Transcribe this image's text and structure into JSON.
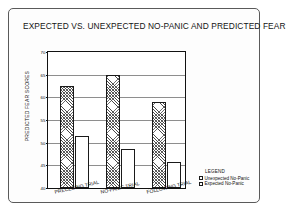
{
  "figure": {
    "title": "EXPECTED VS. UNEXPECTED NO-PANIC AND PREDICTED FEAR"
  },
  "chart_data": {
    "type": "bar",
    "title": "EXPECTED VS. UNEXPECTED NO-PANIC AND PREDICTED FEAR",
    "xlabel": "",
    "ylabel": "PREDICTED FEAR SCORES",
    "ylim": [
      40,
      70
    ],
    "yticks": [
      40,
      45,
      50,
      55,
      60,
      65,
      70
    ],
    "ytick_labels": [
      "40",
      "45",
      "50",
      "55",
      "60",
      "65",
      "70"
    ],
    "grid": true,
    "legend_position": "right-bottom-outside",
    "legend_title": "LEGEND",
    "categories": [
      "PRECEDING TRIAL",
      "NO-PANIC TRIAL",
      "FOLLOWING TRIAL"
    ],
    "series": [
      {
        "name": "Unexpected No-Panic",
        "fill": "hatched",
        "values": [
          62.6,
          65.0,
          59.0
        ]
      },
      {
        "name": "Expected No-Panic",
        "fill": "white",
        "values": [
          51.5,
          48.7,
          45.8
        ]
      }
    ]
  },
  "axis": {
    "y_title": "PREDICTED FEAR SCORES"
  },
  "legend": {
    "title": "LEGEND",
    "entries": [
      {
        "label": "Unexpected No-Panic",
        "swatch": "hatched-swatch"
      },
      {
        "label": "Expected No-Panic",
        "swatch": "white-swatch"
      }
    ]
  },
  "colors": {
    "frame": "#5a5a5a",
    "axis": "#111111",
    "grid": "#8e8e8e",
    "bar_outline": "#1a1a1a",
    "background": "#ffffff"
  }
}
